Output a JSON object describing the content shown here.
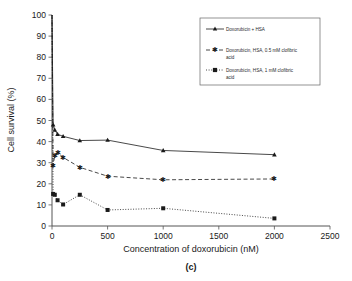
{
  "chart_data": {
    "type": "line",
    "title": "",
    "caption": "(c)",
    "xlabel": "Concentration of doxorubicin (nM)",
    "ylabel": "Cell survival (%)",
    "xlim": [
      0,
      2500
    ],
    "ylim": [
      0,
      100
    ],
    "xticks": [
      0,
      500,
      1000,
      1500,
      2000,
      2500
    ],
    "yticks": [
      0,
      10,
      20,
      30,
      40,
      50,
      60,
      70,
      80,
      90,
      100
    ],
    "grid": false,
    "legend_position": "top-right",
    "series": [
      {
        "name": "Doxorubicin + HSA",
        "marker": "triangle",
        "linestyle": "solid",
        "color": "#1a1a1a",
        "x": [
          0,
          10,
          25,
          50,
          100,
          250,
          500,
          1000,
          2000
        ],
        "y": [
          100,
          48.0,
          45.5,
          43.5,
          42.5,
          40.5,
          40.7,
          35.8,
          33.8
        ]
      },
      {
        "name": "Doxorubicin, HSA, 0.5 mM clofibric acid",
        "marker": "asterisk",
        "linestyle": "dashed",
        "color": "#1a1a1a",
        "x": [
          0,
          10,
          25,
          50,
          100,
          250,
          500,
          1000,
          2000
        ],
        "y": [
          100,
          28.5,
          33.5,
          34.8,
          32.5,
          27.8,
          23.6,
          21.9,
          22.3
        ]
      },
      {
        "name": "Doxorubicin, HSA, 1 mM clofibric acid",
        "marker": "square",
        "linestyle": "dotted",
        "color": "#1a1a1a",
        "x": [
          0,
          10,
          25,
          50,
          100,
          250,
          500,
          1000,
          2000
        ],
        "y": [
          100,
          15.2,
          14.8,
          12.2,
          10.2,
          14.8,
          7.6,
          8.4,
          3.6
        ]
      }
    ]
  },
  "legend": {
    "entries": [
      {
        "label": "Doxorubicin + HSA"
      },
      {
        "label": "Doxorubicin, HSA, 0.5 mM clofibric",
        "label2": "acid"
      },
      {
        "label": "Doxorubicin, HSA, 1 mM clofibric",
        "label2": "acid"
      }
    ]
  }
}
